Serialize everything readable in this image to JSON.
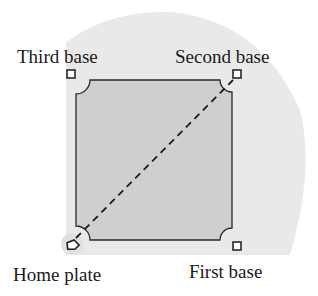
{
  "diagram": {
    "type": "baseball-diamond",
    "labels": {
      "third_base": "Third base",
      "second_base": "Second base",
      "home_plate": "Home plate",
      "first_base": "First base"
    },
    "colors": {
      "outfield": "#e9e9e9",
      "infield": "#cfcfcf",
      "lines": "#2a2a2a",
      "text": "#1a1a1a"
    },
    "dashed_line": "home-plate-to-second-base"
  }
}
